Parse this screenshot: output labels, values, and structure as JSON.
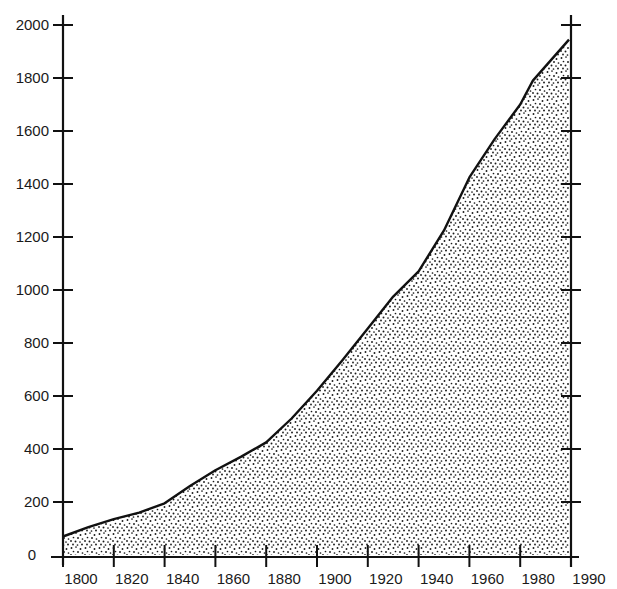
{
  "chart_data": {
    "type": "area",
    "title": "",
    "xlabel": "",
    "ylabel": "",
    "x_tick_labels": [
      "1800",
      "1820",
      "1840",
      "1860",
      "1880",
      "1900",
      "1920",
      "1940",
      "1960",
      "1980",
      "1990"
    ],
    "y_tick_labels": [
      "0",
      "200",
      "400",
      "600",
      "800",
      "1000",
      "1200",
      "1400",
      "1600",
      "1800",
      "2000"
    ],
    "ylim": [
      0,
      2000
    ],
    "xlim": [
      1800,
      1990
    ],
    "grid": false,
    "legend": null,
    "fill": "stipple",
    "x": [
      1800,
      1810,
      1820,
      1830,
      1840,
      1850,
      1860,
      1870,
      1880,
      1890,
      1900,
      1910,
      1920,
      1930,
      1940,
      1950,
      1960,
      1970,
      1980,
      1985,
      1990
    ],
    "values": [
      70,
      105,
      135,
      160,
      195,
      260,
      320,
      370,
      425,
      515,
      620,
      735,
      855,
      975,
      1070,
      1225,
      1425,
      1570,
      1700,
      1790,
      1945
    ]
  },
  "colors": {
    "line": "#111111",
    "stipple_dot": "#1a1a1a",
    "background": "#ffffff"
  }
}
